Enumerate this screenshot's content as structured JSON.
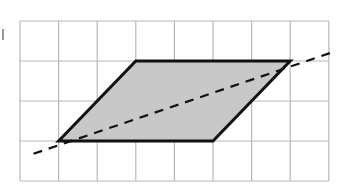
{
  "figure": {
    "type": "grid-diagram",
    "grid": {
      "columns": 8,
      "rows": 4,
      "origin_px": [
        20,
        21
      ],
      "cell_w_px": 38.6,
      "cell_h_px": 40,
      "line_color": "#b8b8b8"
    },
    "parallelogram": {
      "vertices_grid": [
        [
          1,
          3
        ],
        [
          3,
          1
        ],
        [
          7,
          1
        ],
        [
          5,
          3
        ]
      ],
      "fill": "#c8c8c8",
      "stroke": "#111111",
      "stroke_width": 3
    },
    "dashed_line": {
      "from_grid": [
        0.35,
        3.32
      ],
      "to_grid": [
        8.1,
        0.78
      ],
      "stroke": "#111111",
      "stroke_width": 2.2,
      "dash": "9 7",
      "label": "line of symmetry candidate"
    }
  }
}
